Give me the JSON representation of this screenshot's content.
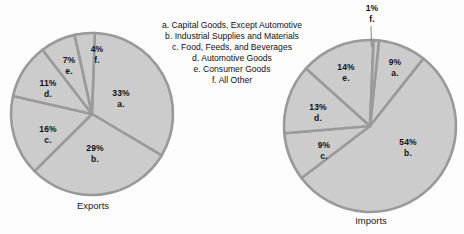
{
  "chart_data": [
    {
      "type": "pie",
      "title": "Exports",
      "categories": [
        "Capital Goods, Except Automotive",
        "Industrial Supplies and Materials",
        "Food, Feeds, and Beverages",
        "Automotive Goods",
        "Consumer Goods",
        "All Other"
      ],
      "keys": [
        "a.",
        "b.",
        "c.",
        "d.",
        "e.",
        "f."
      ],
      "values": [
        33,
        29,
        16,
        11,
        7,
        4
      ],
      "value_labels": [
        "33%",
        "29%",
        "16%",
        "11%",
        "7%",
        "4%"
      ],
      "xlabel": "",
      "ylabel": "",
      "legend_position": "center"
    },
    {
      "type": "pie",
      "title": "Imports",
      "categories": [
        "Capital Goods, Except Automotive",
        "Industrial Supplies and Materials",
        "Food, Feeds, and Beverages",
        "Automotive Goods",
        "Consumer Goods",
        "All Other"
      ],
      "keys": [
        "a.",
        "b.",
        "c.",
        "d.",
        "e.",
        "f."
      ],
      "values": [
        9,
        54,
        9,
        13,
        14,
        1
      ],
      "value_labels": [
        "9%",
        "54%",
        "9%",
        "13%",
        "14%",
        "1%"
      ],
      "xlabel": "",
      "ylabel": "",
      "legend_position": "center"
    }
  ],
  "legend": {
    "items": [
      "a. Capital Goods, Except Automotive",
      "b. Industrial Supplies and Materials",
      "c. Food, Feeds, and Beverages",
      "d. Automotive Goods",
      "e. Consumer Goods",
      "f. All Other"
    ]
  },
  "exports_pie": {
    "caption": "Exports",
    "labels": [
      {
        "pct": "33%",
        "key": "a."
      },
      {
        "pct": "29%",
        "key": "b."
      },
      {
        "pct": "16%",
        "key": "c."
      },
      {
        "pct": "11%",
        "key": "d."
      },
      {
        "pct": "7%",
        "key": "e."
      },
      {
        "pct": "4%",
        "key": "f."
      }
    ]
  },
  "imports_pie": {
    "caption": "Imports",
    "labels": [
      {
        "pct": "9%",
        "key": "a."
      },
      {
        "pct": "54%",
        "key": "b."
      },
      {
        "pct": "9%",
        "key": "c."
      },
      {
        "pct": "13%",
        "key": "d."
      },
      {
        "pct": "14%",
        "key": "e."
      },
      {
        "pct": "1%",
        "key": "f."
      }
    ]
  },
  "colors": {
    "slice_fill": "#cccccc",
    "slice_divider": "#9a9a9a",
    "text": "#111111",
    "background": "#fdfdfd"
  }
}
